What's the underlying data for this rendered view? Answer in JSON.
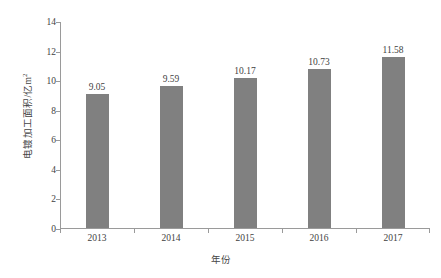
{
  "chart_data": {
    "type": "bar",
    "title": "",
    "subtitle": "",
    "categories": [
      "2013",
      "2014",
      "2015",
      "2016",
      "2017"
    ],
    "values": [
      9.05,
      9.59,
      10.17,
      10.73,
      11.58
    ],
    "value_labels": [
      "9.05",
      "9.59",
      "10.17",
      "10.73",
      "11.58"
    ],
    "xlabel": "年份",
    "ylabel": "电镀加工面积/亿m²",
    "ylabel_main": "电镀加工面积/亿m",
    "ylabel_superscript": "2",
    "ylim": [
      0,
      14
    ],
    "ytick_values": [
      0,
      2,
      4,
      6,
      8,
      10,
      12,
      14
    ],
    "ytick_labels": [
      "0",
      "2",
      "4",
      "6",
      "8",
      "10",
      "12",
      "14"
    ],
    "grid": false,
    "legend": false,
    "legend_position": "none",
    "series": [
      {
        "name": "电镀加工面积",
        "values": [
          9.05,
          9.59,
          10.17,
          10.73,
          11.58
        ]
      }
    ]
  },
  "style": {
    "bar_color": "#808080",
    "axis_color": "#9a9a9a",
    "text_color": "#3f3f3f",
    "background": "#ffffff"
  }
}
